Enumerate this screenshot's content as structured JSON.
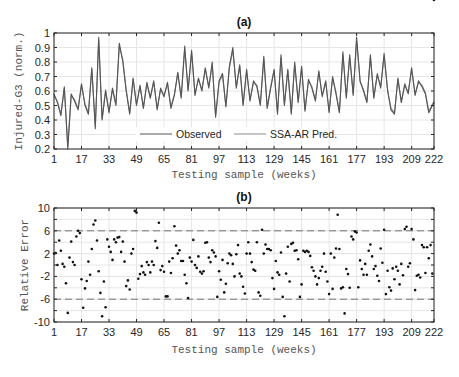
{
  "chart_data": [
    {
      "type": "line",
      "title": "(a)",
      "xlabel": "Testing sample (weeks)",
      "ylabel": "Injured-G3 (norm.)",
      "xlim": [
        1,
        222
      ],
      "ylim": [
        0.2,
        1.0
      ],
      "xticks": [
        1,
        17,
        33,
        49,
        65,
        81,
        97,
        113,
        129,
        145,
        161,
        177,
        193,
        209,
        222
      ],
      "yticks": [
        0.2,
        0.3,
        0.4,
        0.5,
        0.6,
        0.7,
        0.8,
        0.9,
        1.0
      ],
      "grid": true,
      "legend": {
        "position": "lower center",
        "orientation": "horizontal",
        "entries": [
          "Observed",
          "SSA-AR Pred."
        ]
      },
      "series": [
        {
          "name": "Observed",
          "color": "#555555",
          "x": [
            1,
            3,
            5,
            7,
            9,
            11,
            13,
            15,
            17,
            19,
            21,
            23,
            25,
            27,
            29,
            31,
            33,
            35,
            37,
            39,
            41,
            43,
            45,
            47,
            49,
            51,
            53,
            55,
            57,
            59,
            61,
            63,
            65,
            67,
            69,
            71,
            73,
            75,
            77,
            79,
            81,
            83,
            85,
            87,
            89,
            91,
            93,
            95,
            97,
            99,
            101,
            103,
            105,
            107,
            109,
            111,
            113,
            115,
            117,
            119,
            121,
            123,
            125,
            127,
            129,
            131,
            133,
            135,
            137,
            139,
            141,
            143,
            145,
            147,
            149,
            151,
            153,
            155,
            157,
            159,
            161,
            163,
            165,
            167,
            169,
            171,
            173,
            175,
            177,
            179,
            181,
            183,
            185,
            187,
            189,
            191,
            193,
            195,
            197,
            199,
            201,
            203,
            205,
            207,
            209,
            211,
            213,
            215,
            217,
            219,
            222
          ],
          "values": [
            0.58,
            0.52,
            0.43,
            0.63,
            0.2,
            0.58,
            0.53,
            0.47,
            0.65,
            0.5,
            0.44,
            0.76,
            0.34,
            0.97,
            0.4,
            0.6,
            0.45,
            0.62,
            0.5,
            0.93,
            0.8,
            0.6,
            0.44,
            0.69,
            0.5,
            0.64,
            0.48,
            0.66,
            0.55,
            0.67,
            0.47,
            0.62,
            0.56,
            0.66,
            0.48,
            0.57,
            0.73,
            0.55,
            0.91,
            0.6,
            0.88,
            0.57,
            0.69,
            0.6,
            0.76,
            0.62,
            0.8,
            0.42,
            0.67,
            0.72,
            0.49,
            0.77,
            0.9,
            0.62,
            0.78,
            0.5,
            0.75,
            0.53,
            0.67,
            0.63,
            0.5,
            0.84,
            0.48,
            0.62,
            0.75,
            0.44,
            0.85,
            0.5,
            0.75,
            0.44,
            0.8,
            0.52,
            0.77,
            0.46,
            0.68,
            0.62,
            0.53,
            0.74,
            0.56,
            0.67,
            0.45,
            0.7,
            0.58,
            0.45,
            0.87,
            0.55,
            0.85,
            0.57,
            0.97,
            0.67,
            0.6,
            0.52,
            0.85,
            0.55,
            0.72,
            0.62,
            0.86,
            0.6,
            0.47,
            0.44,
            0.69,
            0.52,
            0.65,
            0.58,
            0.76,
            0.57,
            0.67,
            0.63,
            0.58,
            0.45,
            0.52
          ]
        },
        {
          "name": "SSA-AR Pred.",
          "color": "#8c8c8c",
          "x": [
            1,
            3,
            5,
            7,
            9,
            11,
            13,
            15,
            17,
            19,
            21,
            23,
            25,
            27,
            29,
            31,
            33,
            35,
            37,
            39,
            41,
            43,
            45,
            47,
            49,
            51,
            53,
            55,
            57,
            59,
            61,
            63,
            65,
            67,
            69,
            71,
            73,
            75,
            77,
            79,
            81,
            83,
            85,
            87,
            89,
            91,
            93,
            95,
            97,
            99,
            101,
            103,
            105,
            107,
            109,
            111,
            113,
            115,
            117,
            119,
            121,
            123,
            125,
            127,
            129,
            131,
            133,
            135,
            137,
            139,
            141,
            143,
            145,
            147,
            149,
            151,
            153,
            155,
            157,
            159,
            161,
            163,
            165,
            167,
            169,
            171,
            173,
            175,
            177,
            179,
            181,
            183,
            185,
            187,
            189,
            191,
            193,
            195,
            197,
            199,
            201,
            203,
            205,
            207,
            209,
            211,
            213,
            215,
            217,
            219,
            222
          ],
          "values": [
            0.57,
            0.53,
            0.44,
            0.62,
            0.22,
            0.57,
            0.54,
            0.48,
            0.64,
            0.51,
            0.45,
            0.75,
            0.36,
            0.95,
            0.41,
            0.61,
            0.46,
            0.61,
            0.51,
            0.91,
            0.82,
            0.61,
            0.45,
            0.68,
            0.51,
            0.63,
            0.49,
            0.65,
            0.56,
            0.66,
            0.48,
            0.61,
            0.57,
            0.65,
            0.49,
            0.58,
            0.72,
            0.56,
            0.89,
            0.61,
            0.86,
            0.58,
            0.68,
            0.61,
            0.75,
            0.63,
            0.78,
            0.43,
            0.66,
            0.71,
            0.5,
            0.76,
            0.88,
            0.63,
            0.77,
            0.51,
            0.74,
            0.54,
            0.66,
            0.64,
            0.51,
            0.82,
            0.49,
            0.63,
            0.74,
            0.45,
            0.83,
            0.51,
            0.74,
            0.45,
            0.78,
            0.53,
            0.76,
            0.47,
            0.67,
            0.63,
            0.54,
            0.73,
            0.57,
            0.66,
            0.46,
            0.69,
            0.59,
            0.46,
            0.85,
            0.56,
            0.83,
            0.58,
            0.95,
            0.66,
            0.61,
            0.53,
            0.83,
            0.56,
            0.71,
            0.63,
            0.84,
            0.61,
            0.48,
            0.45,
            0.68,
            0.53,
            0.64,
            0.59,
            0.75,
            0.58,
            0.66,
            0.64,
            0.59,
            0.46,
            0.53
          ]
        }
      ]
    },
    {
      "type": "scatter",
      "title": "(b)",
      "xlabel": "Testing sample (weeks)",
      "ylabel": "Relative Error",
      "xlim": [
        1,
        222
      ],
      "ylim": [
        -10,
        10
      ],
      "xticks": [
        1,
        17,
        33,
        49,
        65,
        81,
        97,
        113,
        129,
        145,
        161,
        177,
        193,
        209,
        222
      ],
      "yticks": [
        -10,
        -6,
        -2,
        2,
        6,
        10
      ],
      "grid": true,
      "reference_lines": [
        6,
        -6
      ],
      "series": [
        {
          "name": "Relative Error",
          "color": "#111111",
          "x": [
            1,
            2,
            3,
            4,
            5,
            6,
            7,
            8,
            9,
            10,
            11,
            12,
            13,
            14,
            15,
            16,
            17,
            18,
            19,
            20,
            21,
            22,
            23,
            24,
            25,
            26,
            27,
            28,
            29,
            30,
            31,
            32,
            33,
            34,
            35,
            36,
            37,
            38,
            39,
            40,
            41,
            42,
            43,
            44,
            45,
            46,
            47,
            48,
            49,
            50,
            51,
            52,
            53,
            54,
            55,
            56,
            57,
            58,
            59,
            60,
            61,
            62,
            63,
            64,
            65,
            66,
            67,
            68,
            69,
            70,
            71,
            72,
            73,
            74,
            75,
            76,
            77,
            78,
            79,
            80,
            81,
            82,
            83,
            84,
            85,
            86,
            87,
            88,
            89,
            90,
            91,
            92,
            93,
            94,
            95,
            96,
            97,
            98,
            99,
            100,
            101,
            102,
            103,
            104,
            105,
            106,
            107,
            108,
            109,
            110,
            111,
            112,
            113,
            114,
            115,
            116,
            117,
            118,
            119,
            120,
            121,
            122,
            123,
            124,
            125,
            126,
            127,
            128,
            129,
            130,
            131,
            132,
            133,
            134,
            135,
            136,
            137,
            138,
            139,
            140,
            141,
            142,
            143,
            144,
            145,
            146,
            147,
            148,
            149,
            150,
            151,
            152,
            153,
            154,
            155,
            156,
            157,
            158,
            159,
            160,
            161,
            162,
            163,
            164,
            165,
            166,
            167,
            168,
            169,
            170,
            171,
            172,
            173,
            174,
            175,
            176,
            177,
            178,
            179,
            180,
            181,
            182,
            183,
            184,
            185,
            186,
            187,
            188,
            189,
            190,
            191,
            192,
            193,
            194,
            195,
            196,
            197,
            198,
            199,
            200,
            201,
            202,
            203,
            204,
            205,
            206,
            207,
            208,
            209,
            210,
            211,
            212,
            213,
            214,
            215,
            216,
            217,
            218,
            219,
            220,
            221,
            222
          ],
          "values": [
            2.0,
            2.1,
            0.0,
            4.3,
            2.5,
            0.2,
            -0.3,
            -3.2,
            -8.4,
            1.3,
            4.1,
            0.5,
            0.0,
            5.0,
            6.0,
            5.6,
            -2.5,
            -7.5,
            -4.1,
            -2.8,
            0.6,
            -1.7,
            2.8,
            7.1,
            7.8,
            4.3,
            -1.1,
            -4.9,
            -9.0,
            -2.9,
            -7.4,
            4.5,
            3.2,
            2.3,
            0.9,
            4.5,
            4.0,
            4.8,
            4.9,
            2.3,
            4.1,
            0.6,
            -3.7,
            -2.7,
            -4.3,
            2.0,
            2.8,
            9.5,
            9.2,
            -2.4,
            -1.6,
            -0.2,
            -1.3,
            -1.7,
            0.5,
            0.0,
            -1.3,
            0.6,
            0.0,
            4.2,
            3.0,
            7.4,
            -0.9,
            -0.2,
            -1.2,
            -5.5,
            -5.5,
            0.6,
            -1.4,
            1.2,
            6.8,
            3.4,
            2.0,
            2.6,
            0.7,
            0.7,
            -1.7,
            -3.2,
            -5.8,
            1.3,
            0.6,
            4.4,
            0.0,
            -0.5,
            1.5,
            -1.2,
            -1.5,
            -1.1,
            3.9,
            4.0,
            1.3,
            0.5,
            2.6,
            2.2,
            1.5,
            -5.6,
            -1.1,
            -2.6,
            0.9,
            -4.8,
            -3.3,
            0.3,
            2.0,
            1.7,
            0.2,
            -2.0,
            1.9,
            3.5,
            -1.5,
            -2.0,
            -3.8,
            -5.0,
            2.0,
            4.0,
            2.0,
            0.5,
            -0.8,
            -1.0,
            4.0,
            -4.8,
            -5.4,
            6.2,
            2.0,
            3.6,
            2.8,
            2.8,
            2.6,
            -2.3,
            -4.2,
            0.7,
            -1.3,
            -1.7,
            2.2,
            -5.6,
            -9.0,
            -1.5,
            3.2,
            -2.9,
            3.7,
            3.9,
            2.5,
            2.6,
            1.0,
            -5.6,
            -3.4,
            2.5,
            2.3,
            2.5,
            2.3,
            1.6,
            -0.4,
            -1.0,
            -2.0,
            -3.4,
            -2.3,
            -1.0,
            -0.3,
            2.0,
            -1.2,
            -2.9,
            -5.1,
            2.0,
            -4.2,
            1.3,
            2.9,
            8.8,
            2.8,
            -4.1,
            -3.9,
            -8.5,
            -0.7,
            -1.6,
            -4.0,
            5.0,
            4.5,
            5.9,
            5.7,
            -3.9,
            0.8,
            -0.7,
            -1.7,
            0.2,
            -1.7,
            2.5,
            3.6,
            1.5,
            -0.7,
            -0.2,
            -1.9,
            -2.8,
            2.9,
            0.4,
            6.2,
            -5.1,
            -1.0,
            -3.9,
            -4.5,
            -0.6,
            -2.5,
            -0.3,
            -1.0,
            -3.4,
            0.2,
            -1.8,
            6.3,
            6.7,
            -0.3,
            0.3,
            6.3,
            4.5,
            -4.4,
            -1.9,
            -1.7,
            -2.2,
            3.5,
            3.1,
            -1.4,
            3.1,
            1.2,
            3.5,
            -1.5
          ]
        }
      ]
    }
  ],
  "plot_a": {
    "title": "(a)",
    "ylabel": "Injured-G3 (norm.)",
    "xlabel": "Testing sample (weeks)",
    "legend_observed": "Observed",
    "legend_pred": "SSA-AR Pred."
  },
  "plot_b": {
    "title": "(b)",
    "ylabel": "Relative Error",
    "xlabel": "Testing sample (weeks)"
  },
  "colors": {
    "observed": "#555555",
    "pred": "#8c8c8c",
    "grid": "#e6e6e6",
    "axis": "#262626",
    "refline": "#777777"
  }
}
